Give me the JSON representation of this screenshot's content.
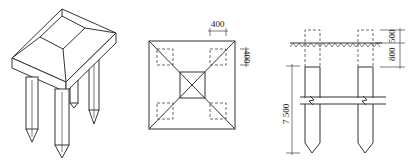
{
  "figure": {
    "panels": [
      {
        "id": "isometric",
        "description": "Pile cap with four piles, isometric view"
      },
      {
        "id": "plan",
        "description": "Plan view of pile cap with four piles"
      },
      {
        "id": "section",
        "description": "Elevation/section of piles below ground"
      }
    ],
    "plan": {
      "dim_top": "400",
      "dim_right": "400"
    },
    "section": {
      "dim_upper": "500",
      "dim_lower": "800",
      "dim_pile_length": "7 500"
    }
  }
}
